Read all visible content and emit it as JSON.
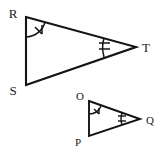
{
  "figure": {
    "background_color": "#ffffff",
    "stroke_color": "#141414",
    "label_color": "#1a1a1a",
    "width": 162,
    "height": 158
  },
  "triangles": [
    {
      "id": "triangle-rst",
      "name": "Triangle RST",
      "size": "large",
      "vertices": [
        {
          "key": "R",
          "label": "R",
          "x": 26,
          "y": 17,
          "label_x": 13,
          "label_y": 13,
          "angle_marks": 1
        },
        {
          "key": "S",
          "label": "S",
          "x": 26,
          "y": 85,
          "label_x": 13,
          "label_y": 93,
          "angle_marks": 0
        },
        {
          "key": "T",
          "label": "T",
          "x": 136,
          "y": 47,
          "label_x": 142,
          "label_y": 51,
          "angle_marks": 2
        }
      ],
      "path": "M 26 17 L 136 47 L 26 85 Z"
    },
    {
      "id": "triangle-opq",
      "name": "Triangle OPQ",
      "size": "small",
      "vertices": [
        {
          "key": "O",
          "label": "O",
          "x": 89,
          "y": 101,
          "label_x": 80,
          "label_y": 97,
          "angle_marks": 1
        },
        {
          "key": "P",
          "label": "P",
          "x": 89,
          "y": 136,
          "label_x": 77,
          "label_y": 144,
          "angle_marks": 0
        },
        {
          "key": "Q",
          "label": "Q",
          "x": 140,
          "y": 119,
          "label_x": 145,
          "label_y": 123,
          "angle_marks": 2
        }
      ],
      "path": "M 89 101 L 140 119 L 89 136 Z"
    }
  ],
  "angle_markers": [
    {
      "id": "angle-mark-r",
      "at_vertex": "R",
      "ticks": 1,
      "triangle": "triangle-rst"
    },
    {
      "id": "angle-mark-t",
      "at_vertex": "T",
      "ticks": 2,
      "triangle": "triangle-rst"
    },
    {
      "id": "angle-mark-o",
      "at_vertex": "O",
      "ticks": 1,
      "triangle": "triangle-opq"
    },
    {
      "id": "angle-mark-q",
      "at_vertex": "Q",
      "ticks": 2,
      "triangle": "triangle-opq"
    }
  ]
}
